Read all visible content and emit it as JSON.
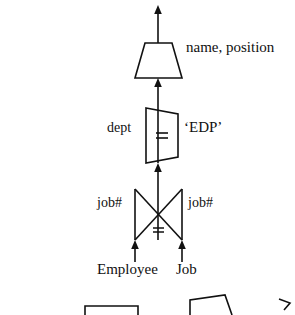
{
  "figure": {
    "stroke_color": "#111111",
    "background_color": "#ffffff",
    "nodes": [
      {
        "id": "projection",
        "symbol": "trapezoid",
        "role": "project-operator",
        "label": "name, position"
      },
      {
        "id": "selection",
        "symbol": "parallelogram",
        "role": "select-operator",
        "left_label": "dept",
        "operator": "=",
        "right_label": "‘EDP’"
      },
      {
        "id": "join",
        "symbol": "bowtie",
        "role": "join-operator",
        "left_label": "job#",
        "operator": "=",
        "right_label": "job#"
      },
      {
        "id": "relation-employee",
        "symbol": "leaf",
        "role": "base-relation",
        "label": "Employee"
      },
      {
        "id": "relation-job",
        "symbol": "leaf",
        "role": "base-relation",
        "label": "Job"
      }
    ],
    "labels": {
      "projection_attributes": "name, position",
      "selection_attribute": "dept",
      "selection_operator": "=",
      "selection_value": "‘EDP’",
      "join_left_attribute": "job#",
      "join_operator": "=",
      "join_right_attribute": "job#",
      "relation_left": "Employee",
      "relation_right": "Job"
    },
    "partial_shapes_bottom": [
      {
        "id": "clipped-rectangle",
        "symbol": "rectangle-top-edge"
      },
      {
        "id": "clipped-trapezoid",
        "symbol": "trapezoid-top-edge"
      },
      {
        "id": "clipped-arrowhead",
        "symbol": "arrow-corner"
      }
    ]
  }
}
